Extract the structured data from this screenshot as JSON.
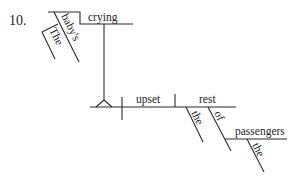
{
  "exercise_number": "10.",
  "diagram": {
    "type": "sentence-diagram",
    "sentence_words": {
      "subject": "baby's",
      "subject_modifiers": [
        "The",
        "baby's"
      ],
      "participle_subject": "crying",
      "verb": "upset",
      "direct_object": "rest",
      "object_modifiers": [
        "the",
        "of"
      ],
      "prepositional_object": "passengers",
      "prepositional_object_modifiers": [
        "the"
      ]
    },
    "labels": {
      "crying": "crying",
      "babys": "baby's",
      "the_1": "The",
      "upset": "upset",
      "rest": "rest",
      "the_2": "the",
      "of": "of",
      "passengers": "passengers",
      "the_3": "the"
    }
  }
}
